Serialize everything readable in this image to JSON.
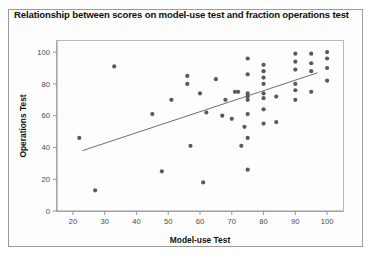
{
  "figure": {
    "title": "Relationship between scores on model-use test and fraction operations test",
    "background_color": "#ffffff",
    "border_color": "#9a9a9a",
    "marker_color": "#5a5a5a",
    "line_color": "#5d5d5d"
  },
  "chart_data": {
    "type": "scatter",
    "title": "Relationship between scores on model-use test and fraction operations test",
    "xlabel": "Model-use Test",
    "ylabel": "Operations Test",
    "xlim": [
      15,
      105
    ],
    "ylim": [
      0,
      107
    ],
    "xticks": [
      20,
      30,
      40,
      50,
      60,
      70,
      80,
      90,
      100
    ],
    "yticks": [
      0,
      20,
      40,
      60,
      80,
      100
    ],
    "grid": false,
    "legend": false,
    "points": [
      [
        22,
        46
      ],
      [
        27,
        13
      ],
      [
        33,
        91
      ],
      [
        45,
        61
      ],
      [
        48,
        25
      ],
      [
        51,
        70
      ],
      [
        56,
        85
      ],
      [
        56,
        80
      ],
      [
        57,
        41
      ],
      [
        60,
        74
      ],
      [
        61,
        18
      ],
      [
        62,
        62
      ],
      [
        65,
        83
      ],
      [
        67,
        60
      ],
      [
        68,
        70
      ],
      [
        70,
        58
      ],
      [
        71,
        75
      ],
      [
        72,
        75
      ],
      [
        73,
        41
      ],
      [
        74,
        53
      ],
      [
        75,
        96
      ],
      [
        75,
        86
      ],
      [
        75,
        74
      ],
      [
        75,
        72
      ],
      [
        75,
        70
      ],
      [
        75,
        61
      ],
      [
        75,
        46
      ],
      [
        75,
        26
      ],
      [
        80,
        92
      ],
      [
        80,
        88
      ],
      [
        80,
        84
      ],
      [
        80,
        80
      ],
      [
        80,
        74
      ],
      [
        80,
        71
      ],
      [
        80,
        64
      ],
      [
        80,
        55
      ],
      [
        84,
        72
      ],
      [
        84,
        56
      ],
      [
        90,
        99
      ],
      [
        90,
        94
      ],
      [
        90,
        89
      ],
      [
        90,
        80
      ],
      [
        90,
        76
      ],
      [
        90,
        70
      ],
      [
        95,
        99
      ],
      [
        95,
        93
      ],
      [
        95,
        88
      ],
      [
        95,
        75
      ],
      [
        100,
        100
      ],
      [
        100,
        96
      ],
      [
        100,
        90
      ],
      [
        100,
        82
      ]
    ],
    "trend_line": {
      "type": "linear-fit",
      "x_start": 23,
      "y_start": 38,
      "x_end": 97,
      "y_end": 87
    }
  }
}
